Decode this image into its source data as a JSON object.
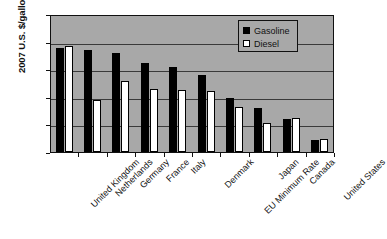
{
  "chart_data": {
    "type": "bar",
    "title": "",
    "xlabel": "",
    "ylabel": "2007 U.S. $/gallon",
    "ylim": [
      0,
      5
    ],
    "ytick_labels": [
      "$0",
      "$1",
      "$2",
      "$3",
      "$4",
      "$5"
    ],
    "ytick_values": [
      0,
      1,
      2,
      3,
      4,
      5
    ],
    "grid": true,
    "legend_position": "top-right",
    "plot_background": "#a8a8a8",
    "categories": [
      "United Kingdom",
      "Netherlands",
      "Germany",
      "France",
      "Italy",
      "Denmark",
      "EU Minimum Rate",
      "Japan",
      "Canada",
      "United States"
    ],
    "series": [
      {
        "name": "Gasoline",
        "color": "#000000",
        "values": [
          3.78,
          3.7,
          3.6,
          3.22,
          3.08,
          2.78,
          1.97,
          1.6,
          1.2,
          0.42
        ]
      },
      {
        "name": "Diesel",
        "color": "#ffffff",
        "values": [
          3.85,
          1.88,
          2.56,
          2.28,
          2.25,
          2.21,
          1.63,
          1.04,
          1.22,
          0.48
        ]
      }
    ]
  }
}
